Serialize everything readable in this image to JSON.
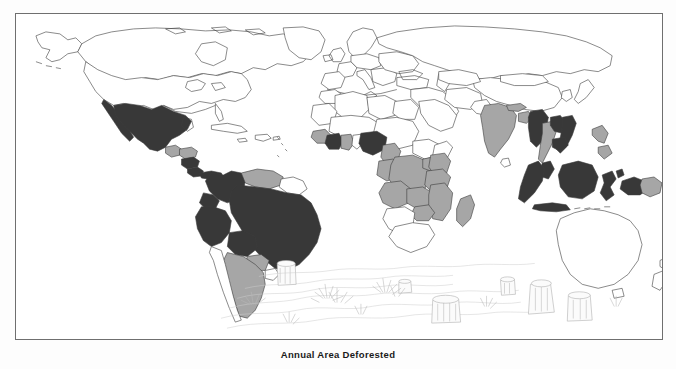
{
  "figure": {
    "caption": "Annual Area Deforested",
    "frame": {
      "border_color": "#6f6f6f",
      "background": "#ffffff"
    }
  },
  "legend_colors": {
    "high": "#383838",
    "moderate": "#a6a6a6",
    "none": "#ffffff",
    "outline": "#3d3d3d",
    "sketch": "#b8b8b8"
  },
  "map": {
    "projection_note": "world",
    "illustration": "clearcut-forest-stumps-sketch",
    "regions": [
      {
        "name": "Canada",
        "shading": "none"
      },
      {
        "name": "United States",
        "shading": "none"
      },
      {
        "name": "Greenland",
        "shading": "none"
      },
      {
        "name": "Mexico",
        "shading": "high"
      },
      {
        "name": "Guatemala",
        "shading": "moderate"
      },
      {
        "name": "Honduras",
        "shading": "moderate"
      },
      {
        "name": "Nicaragua",
        "shading": "high"
      },
      {
        "name": "Costa Rica",
        "shading": "high"
      },
      {
        "name": "Panama",
        "shading": "high"
      },
      {
        "name": "Cuba",
        "shading": "none"
      },
      {
        "name": "Hispaniola",
        "shading": "none"
      },
      {
        "name": "Colombia",
        "shading": "high"
      },
      {
        "name": "Venezuela",
        "shading": "moderate"
      },
      {
        "name": "Guyana",
        "shading": "none"
      },
      {
        "name": "Ecuador",
        "shading": "high"
      },
      {
        "name": "Peru",
        "shading": "high"
      },
      {
        "name": "Brazil",
        "shading": "high"
      },
      {
        "name": "Bolivia",
        "shading": "high"
      },
      {
        "name": "Paraguay",
        "shading": "moderate"
      },
      {
        "name": "Argentina",
        "shading": "moderate"
      },
      {
        "name": "Chile",
        "shading": "none"
      },
      {
        "name": "Uruguay",
        "shading": "none"
      },
      {
        "name": "Europe",
        "shading": "none"
      },
      {
        "name": "Russia",
        "shading": "none"
      },
      {
        "name": "North Africa",
        "shading": "none"
      },
      {
        "name": "Ivory Coast",
        "shading": "high"
      },
      {
        "name": "Ghana",
        "shading": "moderate"
      },
      {
        "name": "Liberia",
        "shading": "moderate"
      },
      {
        "name": "Nigeria",
        "shading": "high"
      },
      {
        "name": "Cameroon",
        "shading": "moderate"
      },
      {
        "name": "Gabon",
        "shading": "moderate"
      },
      {
        "name": "Congo",
        "shading": "moderate"
      },
      {
        "name": "Zaire",
        "shading": "moderate"
      },
      {
        "name": "Angola",
        "shading": "moderate"
      },
      {
        "name": "Zambia",
        "shading": "moderate"
      },
      {
        "name": "Tanzania",
        "shading": "moderate"
      },
      {
        "name": "Kenya",
        "shading": "moderate"
      },
      {
        "name": "Mozambique",
        "shading": "moderate"
      },
      {
        "name": "Zimbabwe",
        "shading": "moderate"
      },
      {
        "name": "Madagascar",
        "shading": "moderate"
      },
      {
        "name": "South Africa",
        "shading": "none"
      },
      {
        "name": "India",
        "shading": "moderate"
      },
      {
        "name": "Bangladesh",
        "shading": "moderate"
      },
      {
        "name": "Myanmar",
        "shading": "high"
      },
      {
        "name": "Thailand",
        "shading": "moderate"
      },
      {
        "name": "Laos",
        "shading": "high"
      },
      {
        "name": "Vietnam",
        "shading": "high"
      },
      {
        "name": "Cambodia",
        "shading": "high"
      },
      {
        "name": "Malaysia",
        "shading": "high"
      },
      {
        "name": "Sumatra",
        "shading": "high"
      },
      {
        "name": "Borneo",
        "shading": "high"
      },
      {
        "name": "Java",
        "shading": "high"
      },
      {
        "name": "Sulawesi",
        "shading": "high"
      },
      {
        "name": "Philippines",
        "shading": "moderate"
      },
      {
        "name": "Irian Jaya",
        "shading": "high"
      },
      {
        "name": "Papua New Guinea",
        "shading": "moderate"
      },
      {
        "name": "China",
        "shading": "none"
      },
      {
        "name": "Japan",
        "shading": "none"
      },
      {
        "name": "Australia",
        "shading": "none"
      },
      {
        "name": "New Zealand",
        "shading": "none"
      }
    ]
  }
}
